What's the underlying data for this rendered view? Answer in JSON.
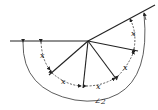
{
  "diagram": {
    "type": "angle-geometry",
    "vertex": [
      88,
      41
    ],
    "angle_labels": [
      "x",
      "x",
      "x",
      "x",
      "x"
    ],
    "outer_angle_label": "∠2"
  }
}
